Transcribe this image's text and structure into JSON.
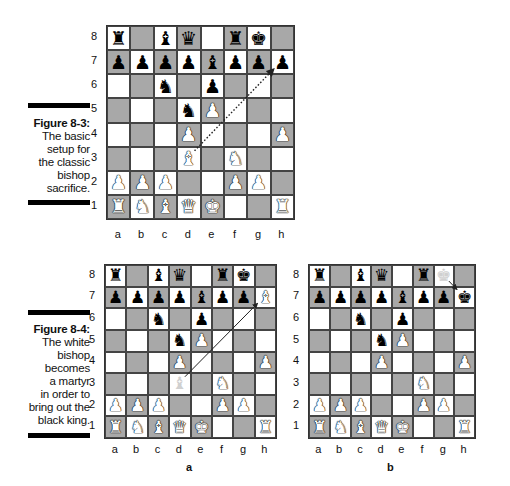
{
  "figures": [
    {
      "label": "Figure 8-3:",
      "text": "The basic\nsetup for\nthe classic\nbishop\nsacrifice."
    },
    {
      "label": "Figure 8-4:",
      "text": "The white\nbishop\nbecomes\na martyr\nin order to\nbring out the\nblack king."
    }
  ],
  "files": [
    "a",
    "b",
    "c",
    "d",
    "e",
    "f",
    "g",
    "h"
  ],
  "ranks": [
    "8",
    "7",
    "6",
    "5",
    "4",
    "3",
    "2",
    "1"
  ],
  "subfigure_labels": {
    "a": "a",
    "b": "b"
  },
  "colors": {
    "light_square": "#ffffff",
    "dark_square": "#a8a8a8",
    "border": "#333333"
  },
  "boards": [
    {
      "name": "figure-8-3-board",
      "position": [
        [
          "br",
          "",
          "bb",
          "bq",
          "",
          "br",
          "bk",
          ""
        ],
        [
          "bp",
          "bp",
          "bp",
          "bp",
          "bb",
          "bp",
          "bp",
          "bp"
        ],
        [
          "",
          "",
          "bn",
          "",
          "bp",
          "",
          "",
          ""
        ],
        [
          "",
          "",
          "",
          "bn",
          "wp",
          "",
          "",
          ""
        ],
        [
          "",
          "",
          "",
          "wp",
          "",
          "",
          "",
          "wp"
        ],
        [
          "",
          "",
          "",
          "wb",
          "",
          "wn",
          "",
          ""
        ],
        [
          "wp",
          "wp",
          "wp",
          "",
          "",
          "wp",
          "wp",
          ""
        ],
        [
          "wr",
          "wn",
          "wb",
          "wq",
          "wk",
          "",
          "",
          "wr"
        ]
      ],
      "arrow": {
        "from": "d3",
        "to": "h7",
        "style": "dotted"
      }
    },
    {
      "name": "figure-8-4a-board",
      "position": [
        [
          "br",
          "",
          "bb",
          "bq",
          "",
          "br",
          "bk",
          ""
        ],
        [
          "bp",
          "bp",
          "bp",
          "bp",
          "bb",
          "bp",
          "bp",
          "wb"
        ],
        [
          "",
          "",
          "bn",
          "",
          "bp",
          "",
          "",
          ""
        ],
        [
          "",
          "",
          "",
          "bn",
          "wp",
          "",
          "",
          ""
        ],
        [
          "",
          "",
          "",
          "wp",
          "",
          "",
          "",
          "wp"
        ],
        [
          "",
          "",
          "",
          "gb",
          "",
          "wn",
          "",
          ""
        ],
        [
          "wp",
          "wp",
          "wp",
          "",
          "",
          "wp",
          "wp",
          ""
        ],
        [
          "wr",
          "wn",
          "wb",
          "wq",
          "wk",
          "",
          "",
          "wr"
        ]
      ],
      "arrow": {
        "from": "d3",
        "to": "h7",
        "style": "solid"
      }
    },
    {
      "name": "figure-8-4b-board",
      "position": [
        [
          "br",
          "",
          "bb",
          "bq",
          "",
          "br",
          "gk",
          ""
        ],
        [
          "bp",
          "bp",
          "bp",
          "bp",
          "bb",
          "bp",
          "bp",
          "bk"
        ],
        [
          "",
          "",
          "bn",
          "",
          "bp",
          "",
          "",
          ""
        ],
        [
          "",
          "",
          "",
          "bn",
          "wp",
          "",
          "",
          ""
        ],
        [
          "",
          "",
          "",
          "wp",
          "",
          "",
          "",
          "wp"
        ],
        [
          "",
          "",
          "",
          "",
          "",
          "wn",
          "",
          ""
        ],
        [
          "wp",
          "wp",
          "wp",
          "",
          "",
          "wp",
          "wp",
          ""
        ],
        [
          "wr",
          "wn",
          "wb",
          "wq",
          "wk",
          "",
          "",
          "wr"
        ]
      ],
      "arrow": {
        "from": "g8",
        "to": "h7",
        "style": "solid"
      }
    }
  ]
}
